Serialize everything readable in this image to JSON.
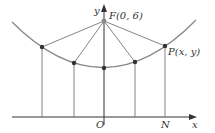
{
  "diagram": {
    "type": "parabola-focus-directrix",
    "axes": {
      "x_label": "x",
      "y_label": "y",
      "origin_label": "O"
    },
    "focus": {
      "label": "F(0, 6)",
      "x": 0,
      "y": 6
    },
    "point": {
      "label": "P(x, y)"
    },
    "foot_label": "N",
    "colors": {
      "curve": "#888888",
      "lines": "#777777",
      "points": "#333333",
      "axes": "#333333"
    }
  }
}
